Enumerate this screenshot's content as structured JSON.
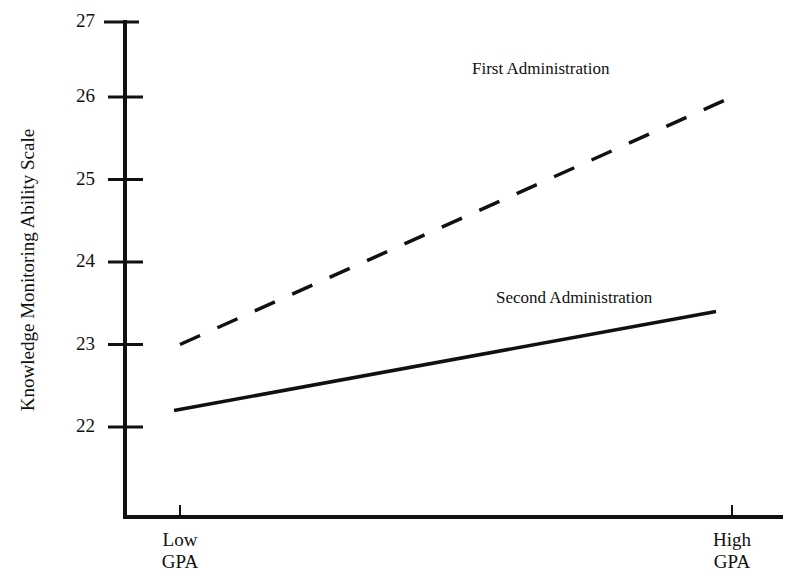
{
  "chart_data": {
    "type": "line",
    "title": "",
    "xlabel": "",
    "ylabel": "Knowledge Monitoring Ability Scale",
    "categories": [
      "Low GPA",
      "High GPA"
    ],
    "category_lines": [
      [
        "Low",
        "GPA"
      ],
      [
        "High",
        "GPA"
      ]
    ],
    "ylim": [
      21,
      27
    ],
    "yticks": [
      22,
      23,
      24,
      25,
      26,
      27
    ],
    "grid": false,
    "legend": "inline labels",
    "series": [
      {
        "name": "First Administration",
        "style": "dashed",
        "values": [
          23.0,
          26.0
        ]
      },
      {
        "name": "Second Administration",
        "style": "solid",
        "values": [
          22.2,
          23.4
        ]
      }
    ]
  },
  "colors": {
    "ink": "#111111",
    "background": "#ffffff"
  }
}
